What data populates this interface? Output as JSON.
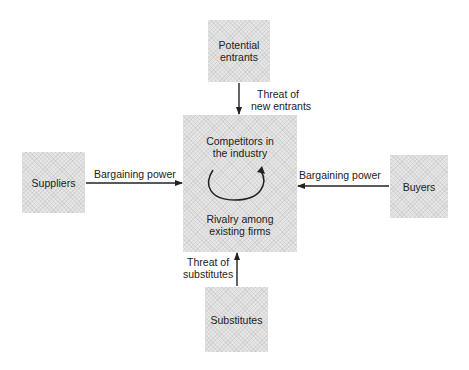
{
  "diagram": {
    "nodes": {
      "potential_entrants": {
        "line1": "Potential",
        "line2": "entrants"
      },
      "industry": {
        "top_line1": "Competitors in",
        "top_line2": "the industry",
        "bottom_line1": "Rivalry among",
        "bottom_line2": "existing firms"
      },
      "suppliers": {
        "label": "Suppliers"
      },
      "buyers": {
        "label": "Buyers"
      },
      "substitutes": {
        "label": "Substitutes"
      }
    },
    "edges": {
      "entrants": {
        "line1": "Threat of",
        "line2": "new entrants"
      },
      "suppliers": {
        "label": "Bargaining power"
      },
      "buyers": {
        "label": "Bargaining power"
      },
      "substitutes": {
        "line1": "Threat of",
        "line2": "substitutes"
      }
    },
    "colors": {
      "box_fill": "#e6e6e6",
      "line": "#222222"
    }
  }
}
